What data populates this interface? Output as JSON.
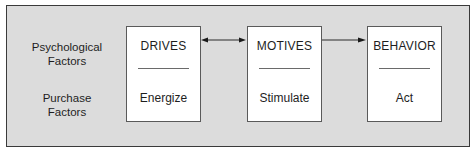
{
  "diagram": {
    "row_labels": {
      "top": "Psychological\nFactors",
      "top_line1": "Psychological",
      "top_line2": "Factors",
      "bottom_line1": "Purchase",
      "bottom_line2": "Factors"
    },
    "boxes": [
      {
        "title": "DRIVES",
        "subtitle": "Energize"
      },
      {
        "title": "MOTIVES",
        "subtitle": "Stimulate"
      },
      {
        "title": "BEHAVIOR",
        "subtitle": "Act"
      }
    ],
    "connectors": [
      {
        "from": "DRIVES",
        "to": "MOTIVES",
        "type": "bidirectional"
      },
      {
        "from": "MOTIVES",
        "to": "BEHAVIOR",
        "type": "forward"
      }
    ],
    "colors": {
      "frame_fill": "#dcdcdc",
      "frame_border": "#3a3a3a",
      "box_fill": "#ffffff",
      "text": "#1e1e1e"
    }
  }
}
